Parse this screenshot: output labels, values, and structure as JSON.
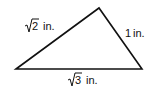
{
  "diagram": {
    "shape": "triangle",
    "vertices": {
      "left": [
        16,
        69
      ],
      "top": [
        99,
        8
      ],
      "right": [
        142,
        69
      ]
    },
    "sides": [
      {
        "id": "left-side",
        "radicand": "2",
        "unit": "in.",
        "label": "√2 in."
      },
      {
        "id": "right-side",
        "value": "1",
        "unit": "in.",
        "label": "1 in."
      },
      {
        "id": "bottom-side",
        "radicand": "3",
        "unit": "in.",
        "label": "√3 in."
      }
    ],
    "stroke_color": "#111111"
  }
}
